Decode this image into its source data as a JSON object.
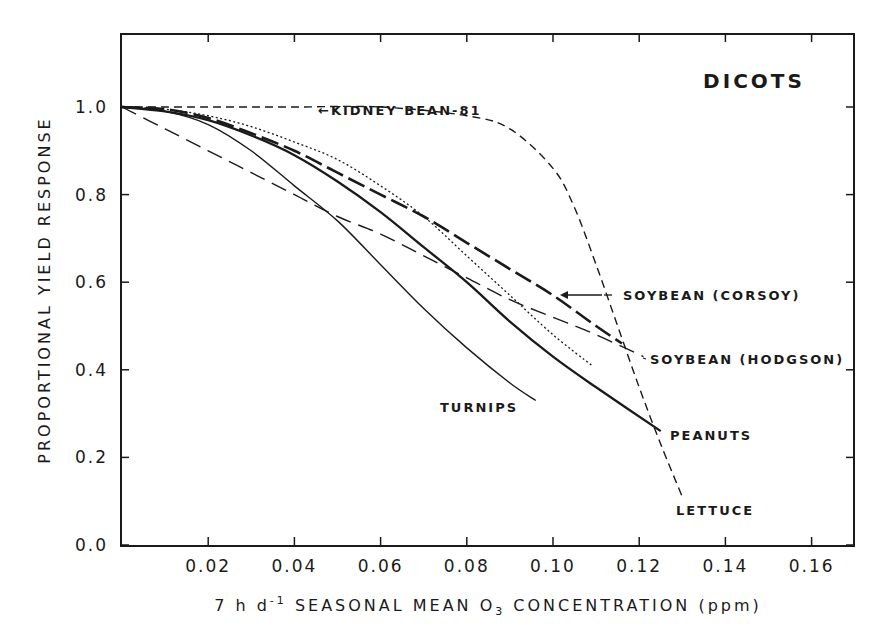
{
  "chart_data": {
    "type": "line",
    "title": "DICOTS",
    "xlabel": "7 h d⁻¹ SEASONAL MEAN O₃ CONCENTRATION (ppm)",
    "ylabel": "PROPORTIONAL YIELD RESPONSE",
    "xlim": [
      0,
      0.17
    ],
    "ylim": [
      0,
      1.2
    ],
    "x_ticks": [
      "0.02",
      "0.04",
      "0.06",
      "0.08",
      "0.10",
      "0.12",
      "0.14",
      "0.16"
    ],
    "y_ticks": [
      "0.0",
      "0.2",
      "0.4",
      "0.6",
      "0.8",
      "1.0"
    ],
    "grid": false,
    "legend_position": "inline labels",
    "series": [
      {
        "name": "LETTUCE",
        "style": "dashed",
        "x": [
          0,
          0.02,
          0.04,
          0.06,
          0.08,
          0.09,
          0.1,
          0.105,
          0.11,
          0.115,
          0.12,
          0.125,
          0.13
        ],
        "y": [
          1.0,
          1.0,
          1.0,
          1.0,
          0.98,
          0.95,
          0.86,
          0.77,
          0.64,
          0.5,
          0.36,
          0.23,
          0.11
        ]
      },
      {
        "name": "KIDNEY BEAN-81",
        "style": "dotted",
        "x": [
          0,
          0.01,
          0.02,
          0.03,
          0.04,
          0.05,
          0.06,
          0.07,
          0.08,
          0.09,
          0.1,
          0.109
        ],
        "y": [
          1.0,
          0.995,
          0.98,
          0.955,
          0.92,
          0.88,
          0.82,
          0.75,
          0.66,
          0.57,
          0.48,
          0.41
        ]
      },
      {
        "name": "SOYBEAN (CORSOY)",
        "style": "long-dashed-bold",
        "x": [
          0,
          0.01,
          0.02,
          0.03,
          0.04,
          0.05,
          0.06,
          0.07,
          0.08,
          0.09,
          0.1,
          0.11,
          0.116
        ],
        "y": [
          1.0,
          0.995,
          0.975,
          0.94,
          0.9,
          0.85,
          0.8,
          0.75,
          0.69,
          0.63,
          0.57,
          0.5,
          0.46
        ]
      },
      {
        "name": "SOYBEAN (HODGSON)",
        "style": "long-dashed",
        "x": [
          0,
          0.01,
          0.02,
          0.03,
          0.04,
          0.05,
          0.06,
          0.07,
          0.08,
          0.09,
          0.1,
          0.11,
          0.121
        ],
        "y": [
          1.0,
          0.95,
          0.9,
          0.85,
          0.8,
          0.75,
          0.71,
          0.66,
          0.61,
          0.56,
          0.52,
          0.48,
          0.43
        ]
      },
      {
        "name": "PEANUTS",
        "style": "solid-bold",
        "x": [
          0,
          0.01,
          0.02,
          0.03,
          0.04,
          0.05,
          0.06,
          0.07,
          0.08,
          0.09,
          0.1,
          0.11,
          0.125
        ],
        "y": [
          1.0,
          0.99,
          0.97,
          0.935,
          0.89,
          0.83,
          0.76,
          0.68,
          0.6,
          0.51,
          0.43,
          0.36,
          0.26
        ]
      },
      {
        "name": "TURNIPS",
        "style": "solid",
        "x": [
          0,
          0.01,
          0.02,
          0.03,
          0.04,
          0.05,
          0.06,
          0.07,
          0.08,
          0.09,
          0.096
        ],
        "y": [
          1.0,
          0.99,
          0.96,
          0.9,
          0.82,
          0.74,
          0.64,
          0.54,
          0.45,
          0.37,
          0.33
        ]
      }
    ],
    "annotations": [
      "KIDNEY BEAN-81",
      "SOYBEAN (CORSOY)",
      "SOYBEAN (HODGSON)",
      "TURNIPS",
      "PEANUTS",
      "LETTUCE"
    ]
  },
  "labels": {
    "title": "DICOTS",
    "ylabel": "PROPORTIONAL YIELD RESPONSE",
    "xlabel_pre": "7 h d",
    "xlabel_sup": "-1",
    "xlabel_mid": " SEASONAL MEAN O",
    "xlabel_sub": "3",
    "xlabel_post": " CONCENTRATION (ppm)",
    "kidney": "←KIDNEY BEAN-81",
    "corsoy": "SOYBEAN (CORSOY)",
    "hodgson": "SOYBEAN (HODGSON)",
    "turnips": "TURNIPS",
    "peanuts": "PEANUTS",
    "lettuce": "LETTUCE"
  }
}
